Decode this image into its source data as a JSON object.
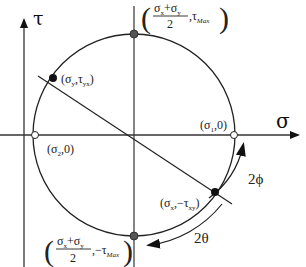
{
  "diagram": {
    "axes": {
      "horizontal_label": "σ",
      "vertical_label": "τ"
    },
    "points": {
      "top": {
        "label_num": "σ",
        "label_num_sub1": "x",
        "label_plus": "+σ",
        "label_num_sub2": "y",
        "label_den": "2",
        "label_tail": ",τ",
        "label_tail_sub": "Max"
      },
      "bottom": {
        "label_num": "σ",
        "label_num_sub1": "x",
        "label_plus": "+σ",
        "label_num_sub2": "y",
        "label_den": "2",
        "label_tail": ",−τ",
        "label_tail_sub": "Max"
      },
      "sigma_y": {
        "base1": "(σ",
        "sub1": "y",
        "mid": ",τ",
        "sub2": "yx",
        "end": ")"
      },
      "sigma_x": {
        "base1": "(σ",
        "sub1": "x",
        "mid": ",−τ",
        "sub2": "xy",
        "end": ")"
      },
      "sigma_1": {
        "base1": "(σ",
        "sub1": "1",
        "end": ",0)"
      },
      "sigma_2": {
        "base1": "(σ",
        "sub1": "2",
        "end": ",0)"
      }
    },
    "angles": {
      "phi": "2ϕ",
      "theta": "2θ"
    },
    "colors": {
      "line": "#222222",
      "filled_point": "#111111",
      "grey_point": "#555555",
      "open_point_fill": "#ffffff"
    }
  }
}
